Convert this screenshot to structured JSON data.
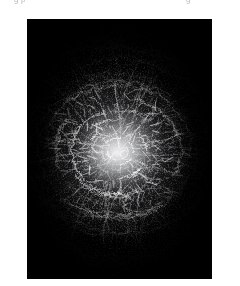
{
  "page": {
    "background_color": "#ffffff",
    "width": 240,
    "height": 286
  },
  "caption": {
    "visible": "partial",
    "note": "line of text clipped by the top edge; only glyph descenders remain legible",
    "left_fragment": "g   p",
    "right_fragment": "g",
    "color": "#b9b9bd"
  },
  "figure": {
    "title": "",
    "alt": "dark radial filament structure converging on a bright core",
    "frame": {
      "x": 27,
      "y": 19,
      "width": 185,
      "height": 260,
      "background_color": "#000000",
      "border": "none"
    },
    "appearance": {
      "background_color": "#000000",
      "filament_color": "#e8ecf1",
      "core_color": "#f2f4f7",
      "midtone_color": "#8f949b",
      "shadow_color": "#05060a"
    },
    "composition": {
      "center_x_pct": 49,
      "center_y_pct": 51,
      "core_radius_pct": 26,
      "structure": "concentric arcs and radial streaks",
      "vignette": "strong, corners pure black",
      "brightest_region": "center",
      "arc_count": 34,
      "radial_count": 120
    }
  },
  "chart_data": {
    "type": "heatmap",
    "title": "",
    "xlabel": "",
    "ylabel": "",
    "grid": false,
    "legend": "none",
    "colormap": "grayscale",
    "vmin": 0,
    "vmax": 255,
    "radial_profile": {
      "r_pct": [
        0,
        10,
        20,
        30,
        40,
        50,
        60,
        70,
        80,
        90,
        100
      ],
      "intensity": [
        235,
        222,
        196,
        160,
        118,
        78,
        46,
        24,
        11,
        4,
        1
      ]
    }
  }
}
